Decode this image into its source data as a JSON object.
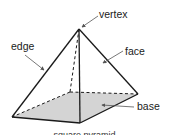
{
  "diagram": {
    "type": "square-pyramid",
    "labels": {
      "vertex": "vertex",
      "edge": "edge",
      "face": "face",
      "base": "base"
    },
    "caption": "square pyramid",
    "colors": {
      "stroke": "#1a1a1a",
      "base_fill": "#d4d4d4",
      "leader": "#555555"
    }
  }
}
